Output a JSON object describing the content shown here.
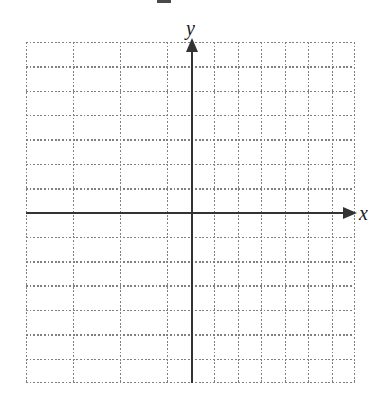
{
  "figure": {
    "kind": "blank-coordinate-grid",
    "background_color": "#ffffff"
  },
  "axes": {
    "x_label": "x",
    "y_label": "y",
    "axis_color": "#333333",
    "axis_line_width": 2,
    "x_axis_arrow": "arrow-right",
    "y_axis_arrow": "arrow-up",
    "origin": {
      "x_px": 192,
      "y_px": 213
    }
  },
  "grid": {
    "style": "dotted",
    "color": "#808080",
    "columns": 14,
    "rows": 14,
    "cell_width_px": 23.5,
    "cell_height_px": 24.35,
    "left_px": 26,
    "top_px": 42,
    "width_px": 329,
    "height_px": 341,
    "tick_labels_shown": false
  },
  "chart_data": {
    "type": "scatter",
    "title": "",
    "subtitle": "",
    "xlabel": "x",
    "ylabel": "y",
    "series": [
      {
        "name": "",
        "x": [],
        "y": []
      }
    ],
    "x": [],
    "values": [],
    "categories": [],
    "xlim": [
      -7,
      7
    ],
    "ylim": [
      -7,
      7
    ],
    "xticks": [
      -7,
      -6,
      -5,
      -4,
      -3,
      -2,
      -1,
      0,
      1,
      2,
      3,
      4,
      5,
      6,
      7
    ],
    "yticks": [
      -7,
      -6,
      -5,
      -4,
      -3,
      -2,
      -1,
      0,
      1,
      2,
      3,
      4,
      5,
      6,
      7
    ],
    "xtick_labels": [],
    "ytick_labels": [],
    "grid": true,
    "grid_style": "dotted",
    "legend": [],
    "legend_position": "none",
    "annotations": []
  }
}
